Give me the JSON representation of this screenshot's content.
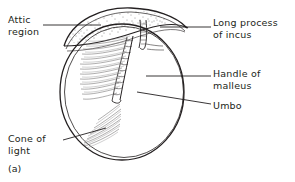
{
  "figure": {
    "caption": "(a)",
    "background_color": "#ffffff",
    "ink_color": "#231f20"
  },
  "labels": [
    {
      "id": "attic-region",
      "line1": "Attic",
      "line2": "region",
      "position": "top-left",
      "leader": "horizontal-right"
    },
    {
      "id": "long-process-of-incus",
      "line1": "Long process",
      "line2": "of incus",
      "position": "top-right",
      "leader": "horizontal-left"
    },
    {
      "id": "handle-of-malleus",
      "line1": "Handle of",
      "line2": "malleus",
      "position": "middle-right",
      "leader": "horizontal-left-arrow"
    },
    {
      "id": "umbo",
      "line1": "Umbo",
      "line2": "",
      "position": "lower-right",
      "leader": "diagonal-up-left"
    },
    {
      "id": "cone-of-light",
      "line1": "Cone of",
      "line2": "light",
      "position": "bottom-left",
      "leader": "diagonal-up-right"
    }
  ]
}
